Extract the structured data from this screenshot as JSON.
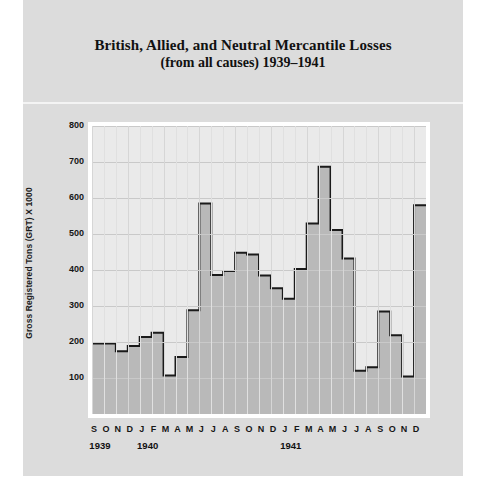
{
  "chart_title": "British, Allied, and Neutral Mercantile Losses",
  "chart_subtitle": "(from all causes) 1939–1941",
  "y_axis_title": "Gross Registered Tons (GRT) X 1000",
  "y_ticks": [
    "800",
    "700",
    "600",
    "500",
    "400",
    "300",
    "200",
    "100"
  ],
  "x_month_labels": [
    "S",
    "O",
    "N",
    "D",
    "J",
    "F",
    "M",
    "A",
    "M",
    "J",
    "J",
    "A",
    "S",
    "O",
    "N",
    "D",
    "J",
    "F",
    "M",
    "A",
    "M",
    "J",
    "J",
    "A",
    "S",
    "O",
    "N",
    "D"
  ],
  "x_year_labels": [
    {
      "label": "1939",
      "start_index": 0,
      "end_index": 3
    },
    {
      "label": "1940",
      "start_index": 4,
      "end_index": 15
    },
    {
      "label": "1941",
      "start_index": 16,
      "end_index": 27
    }
  ],
  "colors": {
    "plate_background": "#dcdcdc",
    "plot_background": "#eaeaea",
    "area_fill": "#b4b4b4",
    "series_line": "#1a1a1a",
    "gridline": "#c9c9c9",
    "frame": "#ffffff",
    "text": "#161616"
  },
  "chart_data": {
    "type": "area",
    "title": "British, Allied, and Neutral Mercantile Losses (from all causes) 1939–1941",
    "subtitle": "(from all causes) 1939–1941",
    "xlabel": "",
    "ylabel": "Gross Registered Tons (GRT) X 1000",
    "ylim": [
      0,
      800
    ],
    "ytick_values": [
      100,
      200,
      300,
      400,
      500,
      600,
      700,
      800
    ],
    "grid": true,
    "legend": "none",
    "step_style": "step-post",
    "categories": [
      "S 1939",
      "O 1939",
      "N 1939",
      "D 1939",
      "J 1940",
      "F 1940",
      "M 1940",
      "A 1940",
      "M 1940",
      "J 1940",
      "J 1940",
      "A 1940",
      "S 1940",
      "O 1940",
      "N 1940",
      "D 1940",
      "J 1941",
      "F 1941",
      "M 1941",
      "A 1941",
      "M 1941",
      "J 1941",
      "J 1941",
      "A 1941",
      "S 1941",
      "O 1941",
      "N 1941",
      "D 1941"
    ],
    "values": [
      196,
      196,
      174,
      189,
      214,
      226,
      107,
      158,
      288,
      585,
      386,
      397,
      448,
      443,
      385,
      349,
      320,
      403,
      529,
      687,
      511,
      432,
      120,
      130,
      285,
      219,
      104,
      580
    ],
    "units": "thousand gross registered tons"
  }
}
